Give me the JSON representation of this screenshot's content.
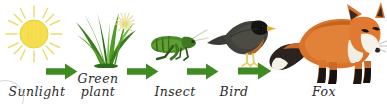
{
  "diagram": {
    "type": "food-chain",
    "background_color": "#ffffff",
    "arrow_color": "#3f8a22",
    "label_color": "#2b2b2b",
    "flow": "Sunlight -> Green plant -> Insect -> Bird -> Fox",
    "nodes": [
      {
        "id": "sunlight",
        "label": "Sunlight",
        "icon": "sun-icon",
        "colors": {
          "disk": "#f5df4e",
          "rays": "#e8d86a"
        }
      },
      {
        "id": "green-plant",
        "label_line1": "Green",
        "label_line2": "plant",
        "label": "Green plant",
        "icon": "grass-plant-icon",
        "colors": {
          "leaf_dark": "#2f6b1f",
          "leaf_mid": "#4e9b2a",
          "leaf_light": "#7cc04a",
          "flower": "#efe9a6"
        }
      },
      {
        "id": "insect",
        "label": "Insect",
        "icon": "grasshopper-icon",
        "colors": {
          "body": "#4d8a2a",
          "body_dark": "#2f5a18",
          "antenna": "#cfcfbf"
        }
      },
      {
        "id": "bird",
        "label": "Bird",
        "icon": "bird-icon",
        "colors": {
          "body": "#3a3a36",
          "head": "#151514",
          "breast": "#a8601f",
          "beak": "#e2b32a",
          "legs": "#e8cd6a"
        }
      },
      {
        "id": "fox",
        "label": "Fox",
        "icon": "fox-icon",
        "colors": {
          "coat": "#d9732b",
          "coat_light": "#e8934a",
          "chest": "#f2ede4",
          "tail_dark": "#2b2320",
          "tail_tip": "#f4f0e8",
          "legs": "#1d1815"
        }
      }
    ],
    "arrows": [
      {
        "id": "arrow-sunlight-to-plant",
        "from": "sunlight",
        "to": "green-plant",
        "direction": "right"
      },
      {
        "id": "arrow-plant-to-insect",
        "from": "green-plant",
        "to": "insect",
        "direction": "right"
      },
      {
        "id": "arrow-insect-to-bird",
        "from": "insect",
        "to": "bird",
        "direction": "right"
      },
      {
        "id": "arrow-bird-to-fox",
        "from": "bird",
        "to": "fox",
        "direction": "right"
      }
    ]
  }
}
